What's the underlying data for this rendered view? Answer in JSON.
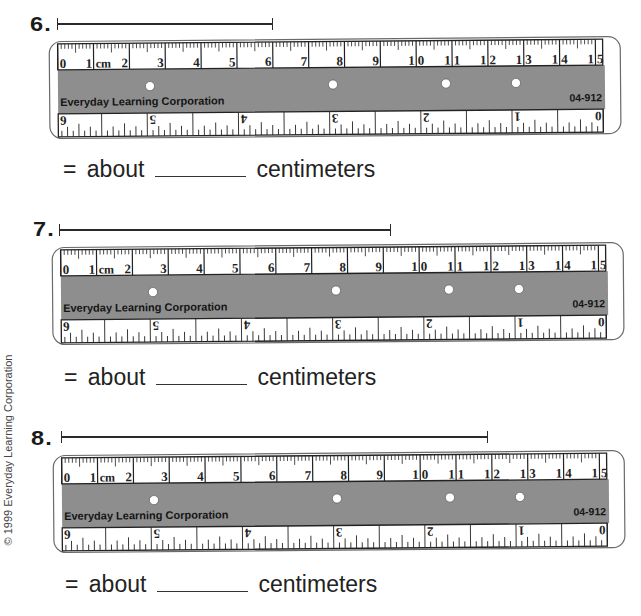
{
  "copyright": "© 1999 Everyday Learning Corporation",
  "colors": {
    "page": "#ffffff",
    "ink": "#222222",
    "ruler_band": "#8e8e8e",
    "ruler_outline": "#6a6a6a",
    "hole": "#ffffff"
  },
  "ruler": {
    "unit_label": "cm",
    "cm_labels": [
      "0",
      "1",
      "2",
      "3",
      "4",
      "5",
      "6",
      "7",
      "8",
      "9",
      "10",
      "11",
      "12",
      "13",
      "14",
      "15"
    ],
    "inch_labels": [
      "0",
      "1",
      "2",
      "3",
      "4",
      "5",
      "6"
    ],
    "brand": "Everyday Learning Corporation",
    "product_code": "04-912"
  },
  "problems": [
    {
      "number": "6.",
      "segment_px": {
        "start": 57,
        "end": 271,
        "y": 24
      },
      "answer": {
        "prefix": "= about",
        "blank": "",
        "unit": "centimeters"
      }
    },
    {
      "number": "7.",
      "segment_px": {
        "start": 59,
        "end": 389,
        "y": 230
      },
      "answer": {
        "prefix": "= about",
        "blank": "",
        "unit": "centimeters"
      }
    },
    {
      "number": "8.",
      "segment_px": {
        "start": 61,
        "end": 486,
        "y": 437
      },
      "answer": {
        "prefix": "= about",
        "blank": "",
        "unit": "centimeters"
      }
    }
  ]
}
